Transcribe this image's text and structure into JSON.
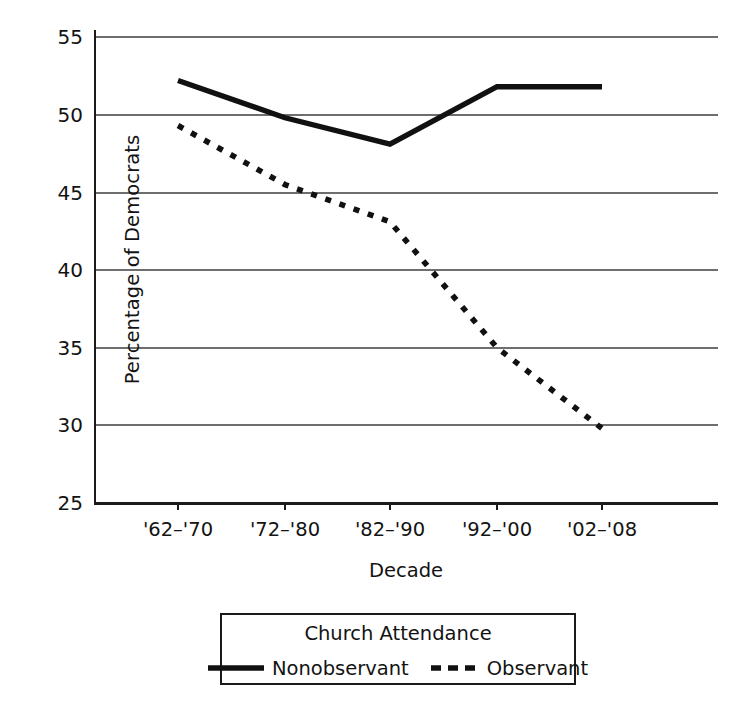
{
  "chart_data": {
    "type": "line",
    "title": "",
    "xlabel": "Decade",
    "ylabel": "Percentage of Democrats",
    "categories": [
      "'62–'70",
      "'72–'80",
      "'82–'90",
      "'92–'00",
      "'02–'08"
    ],
    "series": [
      {
        "name": "Nonobservant",
        "style": "solid",
        "color": "#111111",
        "values": [
          52.2,
          49.8,
          48.1,
          51.8,
          51.8
        ]
      },
      {
        "name": "Observant",
        "style": "dotted",
        "color": "#111111",
        "values": [
          49.3,
          45.5,
          43.1,
          35.0,
          29.8
        ]
      }
    ],
    "ylim": [
      25,
      55
    ],
    "yticks": [
      55,
      50,
      45,
      40,
      35,
      30,
      25
    ],
    "ytick_labels": [
      "55",
      "50",
      "45",
      "40",
      "35",
      "30",
      "25"
    ],
    "grid": "horizontal",
    "legend_position": "below-axes",
    "legend_title": "Church Attendance",
    "axis_color": "#1a1a1a",
    "grid_color": "#6e6e6e",
    "background": "#ffffff"
  },
  "legend": {
    "title": "Church Attendance",
    "entries": [
      {
        "label": "Nonobservant",
        "style": "solid"
      },
      {
        "label": "Observant",
        "style": "dashed"
      }
    ]
  },
  "axes": {
    "x_title": "Decade",
    "y_title": "Percentage of Democrats"
  }
}
